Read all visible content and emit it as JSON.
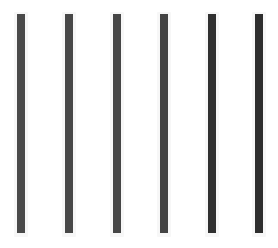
{
  "canvas": {
    "width": 278,
    "height": 248,
    "background": "#ffffff"
  },
  "bars": [
    {
      "index": 1,
      "left": 17,
      "color": "#4a4a4a"
    },
    {
      "index": 2,
      "left": 65,
      "color": "#484848"
    },
    {
      "index": 3,
      "left": 113,
      "color": "#464646"
    },
    {
      "index": 4,
      "left": 160,
      "color": "#444444"
    },
    {
      "index": 5,
      "left": 208,
      "color": "#303030"
    },
    {
      "index": 6,
      "left": 255,
      "color": "#2e2e2e"
    }
  ]
}
